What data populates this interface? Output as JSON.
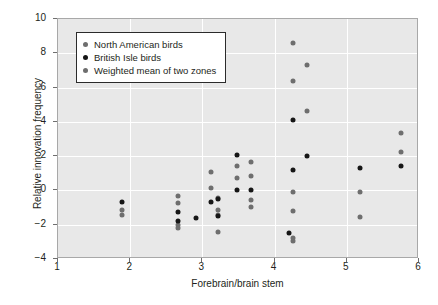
{
  "chart_data": {
    "type": "scatter",
    "title": "",
    "xlabel": "Forebrain/brain stem",
    "ylabel": "Relative innovation frequency",
    "xlim": [
      1,
      6
    ],
    "ylim": [
      -4,
      10
    ],
    "xticks": [
      1,
      2,
      3,
      4,
      5,
      6
    ],
    "yticks": [
      -4,
      -2,
      0,
      2,
      4,
      6,
      8,
      10
    ],
    "grid": true,
    "legend_position": "upper-left",
    "series": [
      {
        "name": "North American birds",
        "color": "#6e6e6e",
        "points": [
          [
            1.88,
            -1.15
          ],
          [
            1.88,
            -1.45
          ],
          [
            2.66,
            -0.3
          ],
          [
            2.66,
            -0.75
          ],
          [
            2.66,
            -2.0
          ],
          [
            2.66,
            -2.2
          ],
          [
            3.12,
            1.05
          ],
          [
            3.12,
            0.15
          ],
          [
            3.22,
            -0.45
          ],
          [
            3.22,
            -1.15
          ],
          [
            3.22,
            -1.45
          ],
          [
            3.22,
            -2.4
          ],
          [
            3.48,
            1.4
          ],
          [
            3.48,
            0.7
          ],
          [
            3.68,
            1.65
          ],
          [
            3.68,
            0.85
          ],
          [
            3.68,
            -0.55
          ],
          [
            3.68,
            -0.95
          ],
          [
            4.25,
            8.6
          ],
          [
            4.25,
            6.4
          ],
          [
            4.25,
            -0.1
          ],
          [
            4.25,
            -1.2
          ],
          [
            4.25,
            -2.75
          ],
          [
            4.25,
            -2.95
          ],
          [
            4.45,
            7.3
          ],
          [
            4.45,
            4.65
          ],
          [
            5.18,
            -0.1
          ],
          [
            5.18,
            -1.55
          ],
          [
            5.75,
            3.35
          ],
          [
            5.75,
            2.25
          ]
        ]
      },
      {
        "name": "British Isle birds",
        "color": "#161616",
        "points": [
          [
            1.88,
            -0.7
          ],
          [
            2.66,
            -1.25
          ],
          [
            2.66,
            -1.8
          ],
          [
            2.91,
            -1.6
          ],
          [
            3.12,
            -0.7
          ],
          [
            3.22,
            -0.5
          ],
          [
            3.22,
            -1.5
          ],
          [
            3.48,
            2.05
          ],
          [
            3.48,
            0.0
          ],
          [
            3.68,
            0.0
          ],
          [
            4.25,
            4.1
          ],
          [
            4.25,
            1.2
          ],
          [
            4.2,
            -2.5
          ],
          [
            4.45,
            2.0
          ],
          [
            5.18,
            1.3
          ],
          [
            5.75,
            1.4
          ]
        ]
      },
      {
        "name": "Weighted mean of two zones",
        "color": "#6e6e6e",
        "points": []
      }
    ],
    "legend": [
      {
        "label": "North American birds",
        "marker": "gray"
      },
      {
        "label": "British Isle birds",
        "marker": "black"
      },
      {
        "label": "Weighted mean of two zones",
        "marker": "gray"
      }
    ]
  }
}
